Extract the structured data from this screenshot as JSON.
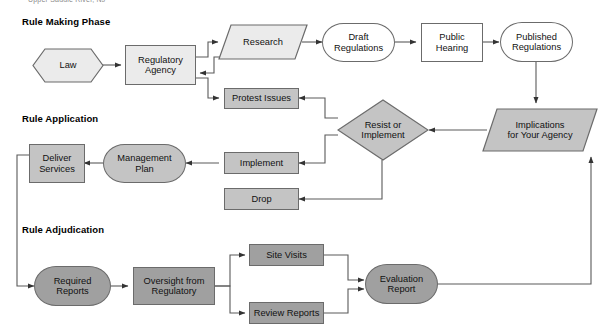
{
  "page": {
    "credit_line": "Upper Saddle River, NJ",
    "width": 615,
    "height": 333
  },
  "colors": {
    "background": "#ffffff",
    "stroke": "#6b6b6b",
    "fill_light": "#ebebeb",
    "fill_mid": "#c4c4c4",
    "fill_dark": "#a0a0a0",
    "fill_white": "#ffffff",
    "text": "#111111",
    "heading_text": "#000000"
  },
  "sections": [
    {
      "id": "rule-making",
      "label": "Rule Making Phase"
    },
    {
      "id": "rule-application",
      "label": "Rule Application"
    },
    {
      "id": "rule-adjudication",
      "label": "Rule Adjudication"
    }
  ],
  "nodes": [
    {
      "id": "law",
      "label": "Law",
      "shape": "hexagon",
      "fill": "light"
    },
    {
      "id": "regulatory-agency",
      "label": "Regulatory\nAgency",
      "shape": "rectangle",
      "fill": "light"
    },
    {
      "id": "research",
      "label": "Research",
      "shape": "parallelogram",
      "fill": "light"
    },
    {
      "id": "draft-regulations",
      "label": "Draft\nRegulations",
      "shape": "stadium",
      "fill": "white"
    },
    {
      "id": "public-hearing",
      "label": "Public\nHearing",
      "shape": "rectangle",
      "fill": "white"
    },
    {
      "id": "published-regulations",
      "label": "Published\nRegulations",
      "shape": "stadium",
      "fill": "white"
    },
    {
      "id": "protest-issues",
      "label": "Protest Issues",
      "shape": "rectangle",
      "fill": "mid"
    },
    {
      "id": "resist-or-implement",
      "label": "Resist or\nImplement",
      "shape": "diamond",
      "fill": "mid"
    },
    {
      "id": "implications",
      "label": "Implications\nfor Your Agency",
      "shape": "parallelogram",
      "fill": "mid"
    },
    {
      "id": "implement",
      "label": "Implement",
      "shape": "rectangle",
      "fill": "mid"
    },
    {
      "id": "drop",
      "label": "Drop",
      "shape": "rectangle",
      "fill": "mid"
    },
    {
      "id": "management-plan",
      "label": "Management\nPlan",
      "shape": "stadium",
      "fill": "mid"
    },
    {
      "id": "deliver-services",
      "label": "Deliver\nServices",
      "shape": "rectangle",
      "fill": "mid"
    },
    {
      "id": "required-reports",
      "label": "Required\nReports",
      "shape": "stadium",
      "fill": "dark"
    },
    {
      "id": "oversight-from-regulatory",
      "label": "Oversight from\nRegulatory",
      "shape": "rectangle",
      "fill": "dark"
    },
    {
      "id": "site-visits",
      "label": "Site Visits",
      "shape": "rectangle",
      "fill": "dark"
    },
    {
      "id": "review-reports",
      "label": "Review Reports",
      "shape": "rectangle",
      "fill": "dark"
    },
    {
      "id": "evaluation-report",
      "label": "Evaluation\nReport",
      "shape": "stadium",
      "fill": "dark"
    }
  ],
  "edges": [
    {
      "from": "law",
      "to": "regulatory-agency"
    },
    {
      "from": "regulatory-agency",
      "to": "research"
    },
    {
      "from": "regulatory-agency",
      "to": "protest-issues"
    },
    {
      "from": "research",
      "to": "regulatory-agency"
    },
    {
      "from": "research",
      "to": "draft-regulations"
    },
    {
      "from": "draft-regulations",
      "to": "public-hearing"
    },
    {
      "from": "public-hearing",
      "to": "published-regulations"
    },
    {
      "from": "published-regulations",
      "to": "implications"
    },
    {
      "from": "implications",
      "to": "resist-or-implement"
    },
    {
      "from": "resist-or-implement",
      "to": "protest-issues"
    },
    {
      "from": "resist-or-implement",
      "to": "implement"
    },
    {
      "from": "resist-or-implement",
      "to": "drop"
    },
    {
      "from": "implement",
      "to": "management-plan"
    },
    {
      "from": "management-plan",
      "to": "deliver-services"
    },
    {
      "from": "deliver-services",
      "to": "required-reports"
    },
    {
      "from": "required-reports",
      "to": "oversight-from-regulatory"
    },
    {
      "from": "oversight-from-regulatory",
      "to": "site-visits"
    },
    {
      "from": "oversight-from-regulatory",
      "to": "review-reports"
    },
    {
      "from": "site-visits",
      "to": "evaluation-report"
    },
    {
      "from": "review-reports",
      "to": "evaluation-report"
    },
    {
      "from": "evaluation-report",
      "to": "implications"
    }
  ]
}
